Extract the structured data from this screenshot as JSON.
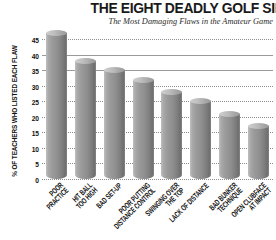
{
  "chart_data": {
    "type": "bar",
    "title": "THE EIGHT DEADLY GOLF SINS",
    "subtitle": "The Most Damaging Flaws in the Amateur Game",
    "xlabel": "",
    "ylabel": "% OF TEACHERS WHO LISTED EACH FLAW",
    "ylim": [
      0,
      47
    ],
    "yticks": [
      0,
      5,
      10,
      15,
      20,
      25,
      30,
      35,
      40,
      45
    ],
    "grid": true,
    "legend": "none",
    "categories": [
      "POOR PRACTICE",
      "HIT BALL TOO HIGH",
      "BAD SET-UP",
      "POOR PUTTING DISTANCE CONTROL",
      "SWINGING OVER THE TOP",
      "LACK OF DISTANCE",
      "BAD BUNKER TECHNIQUE",
      "OPEN CLUBFACE AT IMPACT"
    ],
    "category_lines": [
      [
        "POOR",
        "PRACTICE"
      ],
      [
        "HIT BALL",
        "TOO HIGH"
      ],
      [
        "BAD SET-UP"
      ],
      [
        "POOR PUTTING",
        "DISTANCE CONTROL"
      ],
      [
        "SWINGING OVER",
        "THE TOP"
      ],
      [
        "LACK OF DISTANCE"
      ],
      [
        "BAD BUNKER",
        "TECHNIQUE"
      ],
      [
        "OPEN CLUBFACE",
        "AT IMPACT"
      ]
    ],
    "values": [
      47,
      38,
      35,
      32,
      28,
      25,
      21,
      17
    ],
    "colors": {
      "bar_light": "#bfbfbf",
      "bar_dark": "#6f6f6f",
      "bar_cap": "#cfcfcf",
      "gridline": "#8d8d8d",
      "text": "#111111",
      "background": "#ffffff"
    }
  }
}
